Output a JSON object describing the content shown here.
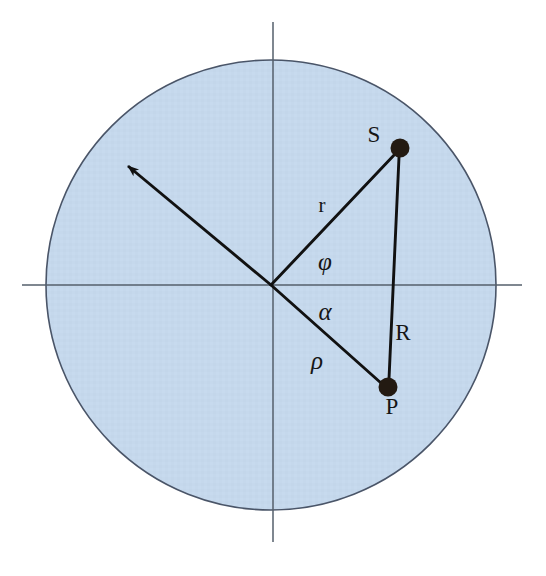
{
  "figure": {
    "type": "geometric-diagram",
    "canvas": {
      "width": 546,
      "height": 576,
      "background": "#ffffff"
    },
    "colors": {
      "disk_fill": "#c5d8ec",
      "disk_stroke": "#4a5568",
      "axis_stroke": "#555f6b",
      "vector_stroke": "#111111",
      "point_fill": "#231a12",
      "label_color": "#161616"
    }
  },
  "disk": {
    "name": "shaded-disk",
    "center_x": 271,
    "center_y": 285,
    "radius": 225,
    "fill": "#c5d8ec",
    "stroke": "#4a5568",
    "stroke_width": 1.6
  },
  "axes": {
    "horizontal": {
      "label": "horizontal-axis",
      "x1": 22,
      "y1": 285,
      "x2": 522,
      "y2": 285
    },
    "vertical": {
      "label": "vertical-axis",
      "x1": 273,
      "y1": 22,
      "x2": 273,
      "y2": 542
    },
    "origin": {
      "x": 271,
      "y": 285
    }
  },
  "points": [
    {
      "id": "S",
      "label": "S",
      "x": 400,
      "y": 148,
      "radius": 9,
      "label_x": 374,
      "label_y": 142
    },
    {
      "id": "P",
      "label": "P",
      "x": 388,
      "y": 387,
      "radius": 9,
      "label_x": 390,
      "label_y": 412
    }
  ],
  "segments": [
    {
      "id": "r",
      "label": "r",
      "from": "origin",
      "to": "S",
      "x1": 271,
      "y1": 285,
      "x2": 396,
      "y2": 152,
      "label_x": 323,
      "label_y": 210,
      "label_style": "upright-lower"
    },
    {
      "id": "R",
      "label": "R",
      "from": "S",
      "to": "P",
      "x1": 399,
      "y1": 157,
      "x2": 389,
      "y2": 379,
      "label_x": 400,
      "label_y": 338,
      "label_style": "upright-upper"
    },
    {
      "id": "rho",
      "label": "ρ",
      "from": "origin",
      "to": "P",
      "x1": 271,
      "y1": 285,
      "x2": 381,
      "y2": 383,
      "label_x": 316,
      "label_y": 367,
      "label_style": "greek-italic"
    },
    {
      "id": "arrow",
      "label": "direction-vector",
      "from": "origin",
      "to": "upper-left-boundary",
      "x1": 271,
      "y1": 285,
      "x2": 124,
      "y2": 163,
      "label_x": null,
      "label_y": null,
      "label_style": "none",
      "has_arrowhead": true
    }
  ],
  "angles": [
    {
      "id": "phi",
      "label": "φ",
      "between": [
        "r",
        "arrow-direction"
      ],
      "label_x": 324,
      "label_y": 268,
      "label_style": "greek-italic"
    },
    {
      "id": "alpha",
      "label": "α",
      "between": [
        "horizontal-axis",
        "rho"
      ],
      "label_x": 324,
      "label_y": 318,
      "label_style": "greek-italic"
    }
  ],
  "labels": {
    "S": "S",
    "P": "P",
    "r": "r",
    "R": "R",
    "rho": "ρ",
    "phi": "φ",
    "alpha": "α"
  }
}
